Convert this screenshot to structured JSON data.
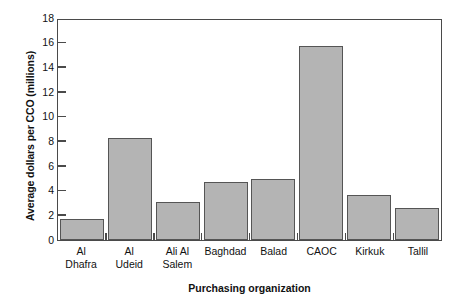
{
  "chart_data": {
    "type": "bar",
    "title": "",
    "xlabel": "Purchasing organization",
    "ylabel": "Average dollars per CCO (millions)",
    "categories": [
      "Al Dhafra",
      "Al Udeid",
      "Ali Al Salem",
      "Baghdad",
      "Balad",
      "CAOC",
      "Kirkuk",
      "Tallil"
    ],
    "category_lines": [
      [
        "Al",
        "Dhafra"
      ],
      [
        "Al",
        "Udeid"
      ],
      [
        "Ali Al",
        "Salem"
      ],
      [
        "Baghdad",
        ""
      ],
      [
        "Balad",
        ""
      ],
      [
        "CAOC",
        ""
      ],
      [
        "Kirkuk",
        ""
      ],
      [
        "Tallil",
        ""
      ]
    ],
    "values": [
      1.7,
      8.3,
      3.1,
      4.7,
      4.95,
      15.7,
      3.65,
      2.6
    ],
    "ylim": [
      0,
      18
    ],
    "ytick_values": [
      0,
      2,
      4,
      6,
      8,
      10,
      12,
      14,
      16,
      18
    ],
    "ytick_labels": [
      "0",
      "2",
      "4",
      "6",
      "8",
      "10",
      "12",
      "14",
      "16",
      "18"
    ],
    "grid": false,
    "legend": "none",
    "bar_color": "#b4b4b4",
    "bar_edge_color": "#555555",
    "axis_color": "#4a4a4a"
  }
}
